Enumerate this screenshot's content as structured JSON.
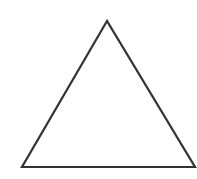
{
  "diagram": {
    "shape": "triangle",
    "style": "outline",
    "stroke_color": "#333333",
    "fill_color": "#ffffff",
    "stroke_width": 2.2,
    "vertices": [
      [
        107,
        21
      ],
      [
        22,
        167
      ],
      [
        195,
        167
      ]
    ]
  }
}
